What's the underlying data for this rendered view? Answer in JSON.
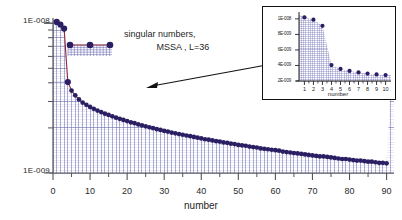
{
  "figure": {
    "annotation_line1": "singular numbers,",
    "annotation_line2": "MSSA , L=36",
    "marker_color": "#2b1e63",
    "grid_color": "#6b6bb5",
    "curve_edge_color": "#8e2a3a",
    "axis_color": "#555555"
  },
  "chart_data": {
    "type": "scatter",
    "title": "",
    "subtitle": "singular numbers, MSSA , L=36",
    "xlabel": "number",
    "ylabel": "",
    "yscale": "log",
    "xlim": [
      0,
      92
    ],
    "ylim": [
      1e-09,
      1.05e-08
    ],
    "grid": true,
    "legend": "none",
    "ytick_labels": [
      "1E-008",
      "1E-009"
    ],
    "ytick_values": [
      1e-08,
      1e-09
    ],
    "xtick_labels": [
      "0",
      "10",
      "20",
      "30",
      "40",
      "50",
      "60",
      "70",
      "80",
      "90"
    ],
    "xtick_values": [
      0,
      10,
      20,
      30,
      40,
      50,
      60,
      70,
      80,
      90
    ],
    "x": [
      1,
      2,
      3,
      4,
      5,
      6,
      7,
      8,
      9,
      10,
      11,
      12,
      13,
      14,
      15,
      16,
      17,
      18,
      19,
      20,
      21,
      22,
      23,
      24,
      25,
      26,
      27,
      28,
      29,
      30,
      31,
      32,
      33,
      34,
      35,
      36,
      37,
      38,
      39,
      40,
      41,
      42,
      43,
      44,
      45,
      46,
      47,
      48,
      49,
      50,
      51,
      52,
      53,
      54,
      55,
      56,
      57,
      58,
      59,
      60,
      61,
      62,
      63,
      64,
      65,
      66,
      67,
      68,
      69,
      70,
      71,
      72,
      73,
      74,
      75,
      76,
      77,
      78,
      79,
      80,
      81,
      82,
      83,
      84,
      85,
      86,
      87,
      88,
      89,
      90
    ],
    "y": [
      1.02e-08,
      9.8e-09,
      9.2e-09,
      4.05e-09,
      3.55e-09,
      3.3e-09,
      3.1e-09,
      2.95e-09,
      2.85e-09,
      2.76e-09,
      2.68e-09,
      2.61e-09,
      2.55e-09,
      2.49e-09,
      2.44e-09,
      2.39e-09,
      2.34e-09,
      2.3e-09,
      2.26e-09,
      2.22e-09,
      2.18e-09,
      2.15e-09,
      2.11e-09,
      2.08e-09,
      2.05e-09,
      2.02e-09,
      1.99e-09,
      1.96e-09,
      1.94e-09,
      1.91e-09,
      1.89e-09,
      1.86e-09,
      1.84e-09,
      1.82e-09,
      1.8e-09,
      1.78e-09,
      1.76e-09,
      1.74e-09,
      1.72e-09,
      1.7e-09,
      1.68e-09,
      1.67e-09,
      1.65e-09,
      1.63e-09,
      1.62e-09,
      1.6e-09,
      1.59e-09,
      1.57e-09,
      1.56e-09,
      1.54e-09,
      1.53e-09,
      1.52e-09,
      1.5e-09,
      1.49e-09,
      1.48e-09,
      1.46e-09,
      1.45e-09,
      1.44e-09,
      1.43e-09,
      1.42e-09,
      1.41e-09,
      1.39e-09,
      1.38e-09,
      1.37e-09,
      1.36e-09,
      1.35e-09,
      1.34e-09,
      1.33e-09,
      1.32e-09,
      1.31e-09,
      1.3e-09,
      1.29e-09,
      1.29e-09,
      1.28e-09,
      1.27e-09,
      1.26e-09,
      1.25e-09,
      1.24e-09,
      1.24e-09,
      1.23e-09,
      1.22e-09,
      1.21e-09,
      1.21e-09,
      1.2e-09,
      1.19e-09,
      1.19e-09,
      1.18e-09,
      1.17e-09,
      1.17e-09,
      1.16e-09
    ]
  },
  "inset": {
    "chart_data": {
      "type": "scatter",
      "xlabel": "number",
      "ylabel": "",
      "yscale": "linear",
      "xlim": [
        0.4,
        10.6
      ],
      "ylim": [
        2e-09,
        1.05e-08
      ],
      "grid": true,
      "ytick_labels": [
        "1E-008",
        "8E-009",
        "6E-009",
        "4E-009",
        "2E-009"
      ],
      "ytick_values": [
        1e-08,
        8e-09,
        6e-09,
        4e-09,
        2e-09
      ],
      "xtick_labels": [
        "1",
        "2",
        "3",
        "4",
        "5",
        "6",
        "7",
        "8",
        "9",
        "10"
      ],
      "xtick_values": [
        1,
        2,
        3,
        4,
        5,
        6,
        7,
        8,
        9,
        10
      ],
      "x": [
        1,
        2,
        3,
        4,
        5,
        6,
        7,
        8,
        9,
        10
      ],
      "y": [
        1.02e-08,
        9.9e-09,
        9.1e-09,
        4.05e-09,
        3.55e-09,
        3.3e-09,
        3.1e-09,
        2.95e-09,
        2.85e-09,
        2.76e-09
      ]
    }
  }
}
